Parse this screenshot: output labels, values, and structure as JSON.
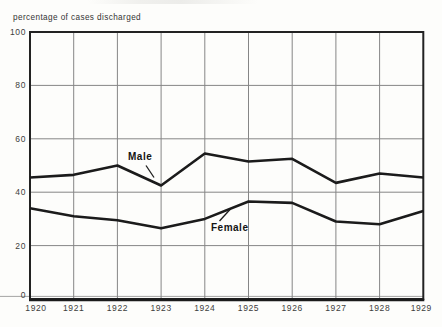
{
  "chart_data": {
    "type": "line",
    "title": "percentage of cases discharged",
    "x": [
      1920,
      1921,
      1922,
      1923,
      1924,
      1925,
      1926,
      1927,
      1928,
      1929
    ],
    "series": [
      {
        "name": "Male",
        "values": [
          45.5,
          46.5,
          50,
          42.5,
          54.5,
          51.5,
          52.5,
          43.5,
          47,
          45.5
        ]
      },
      {
        "name": "Female",
        "values": [
          34,
          31,
          29.5,
          26.5,
          30,
          36.5,
          36,
          29,
          28,
          33
        ]
      }
    ],
    "xlabel": "",
    "ylabel": "percentage of cases discharged",
    "ylim": [
      0,
      100
    ],
    "yticks": [
      0,
      20,
      40,
      60,
      80,
      100
    ],
    "grid": true,
    "legend_position": "inline-labels-on-lines",
    "line_color": "#1b1b1b",
    "grid_color": "#868686",
    "frame_color": "#222222"
  },
  "series_labels": {
    "male": "Male",
    "female": "Female"
  }
}
